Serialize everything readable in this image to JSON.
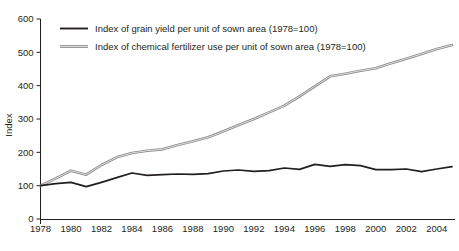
{
  "chart_data": {
    "type": "line",
    "title": "",
    "xlabel": "",
    "ylabel": "Index",
    "ylim": [
      0,
      600
    ],
    "xlim": [
      1978,
      2005
    ],
    "ytick_values": [
      0,
      100,
      200,
      300,
      400,
      500,
      600
    ],
    "ytick_labels": [
      "0",
      "100",
      "200",
      "300",
      "400",
      "500",
      "600"
    ],
    "xtick_labels": [
      "1978",
      "1980",
      "1982",
      "1984",
      "1986",
      "1988",
      "1990",
      "1992",
      "1994",
      "1996",
      "1998",
      "2000",
      "2002",
      "2004"
    ],
    "xtick_values": [
      1978,
      1980,
      1982,
      1984,
      1986,
      1988,
      1990,
      1992,
      1994,
      1996,
      1998,
      2000,
      2002,
      2004
    ],
    "grid": false,
    "legend_position": "upper left inside plot",
    "x": [
      1978,
      1979,
      1980,
      1981,
      1982,
      1983,
      1984,
      1985,
      1986,
      1987,
      1988,
      1989,
      1990,
      1991,
      1992,
      1993,
      1994,
      1995,
      1996,
      1997,
      1998,
      1999,
      2000,
      2001,
      2002,
      2003,
      2004,
      2005
    ],
    "series": [
      {
        "name": "Index of grain yield per unit of sown area (1978=100)",
        "color": "#231f20",
        "values": [
          100,
          106,
          110,
          97,
          110,
          124,
          138,
          131,
          133,
          135,
          134,
          136,
          144,
          147,
          143,
          145,
          153,
          149,
          164,
          158,
          163,
          160,
          148,
          148,
          150,
          142,
          150,
          157
        ]
      },
      {
        "name": "Index of chemical fertilizer use per unit of sown area (1978=100)",
        "color": "#8d8d8d",
        "values": [
          100,
          122,
          145,
          133,
          162,
          185,
          198,
          205,
          209,
          222,
          233,
          245,
          263,
          282,
          300,
          320,
          340,
          368,
          398,
          428,
          436,
          445,
          452,
          467,
          481,
          495,
          510,
          522
        ]
      }
    ]
  },
  "axis": {
    "y_title": "Index"
  },
  "legend": {
    "entries": [
      {
        "label": "Index of grain yield per unit of sown area (1978=100)",
        "swatch": "black-line-swatch"
      },
      {
        "label": "Index of chemical fertilizer use per unit of sown area (1978=100)",
        "swatch": "grey-line-swatch"
      }
    ]
  }
}
